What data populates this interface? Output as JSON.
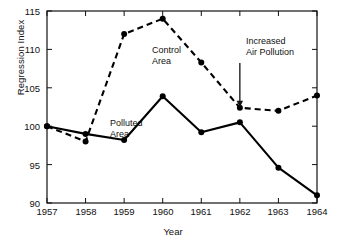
{
  "chart_data": {
    "type": "line",
    "title": "",
    "xlabel": "Year",
    "ylabel": "Regression Index",
    "x": [
      1957,
      1958,
      1959,
      1960,
      1961,
      1962,
      1963,
      1964
    ],
    "xticklabels": [
      "1957",
      "1958",
      "1959",
      "1960",
      "1961",
      "1962",
      "1963",
      "1964"
    ],
    "yticks": [
      90,
      95,
      100,
      105,
      110,
      115
    ],
    "yticklabels": [
      "90",
      "95",
      "100",
      "105",
      "110",
      "115"
    ],
    "ylim": [
      90,
      115
    ],
    "xlim": [
      1957,
      1964
    ],
    "grid": false,
    "legend_position": "inline-annotations",
    "series": [
      {
        "name": "Control Area",
        "style": "dashed",
        "marker": "filled-circle",
        "color": "#000000",
        "values": [
          100,
          98,
          112,
          114,
          108.3,
          102.4,
          102,
          104
        ]
      },
      {
        "name": "Polluted Area",
        "style": "solid",
        "marker": "filled-circle",
        "color": "#000000",
        "values": [
          100,
          99,
          98.2,
          103.9,
          99.2,
          100.5,
          94.6,
          91
        ]
      }
    ],
    "annotations": [
      {
        "text": "Control\nArea",
        "target_series": "Control Area"
      },
      {
        "text": "Polluted\nArea",
        "target_series": "Polluted Area"
      },
      {
        "text": "Increased\nAir Pollution",
        "arrow": "down",
        "target_x": 1962,
        "target_y": 102.4
      }
    ]
  },
  "axis": {
    "frame_color": "#111111",
    "line_color": "#000000"
  }
}
